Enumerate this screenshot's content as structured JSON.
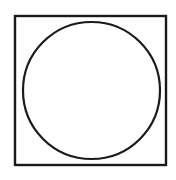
{
  "diagram": {
    "background": "#ffffff",
    "stroke_color": "#1a1a1a",
    "square": {
      "x": 15,
      "y": 16,
      "width": 151,
      "height": 149,
      "stroke_width": 2.4
    },
    "circle": {
      "cx": 91.5,
      "cy": 90.5,
      "r": 68.5,
      "stroke_width": 2.2
    }
  }
}
